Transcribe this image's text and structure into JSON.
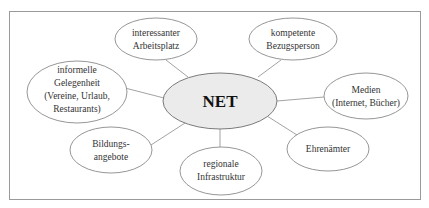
{
  "diagram": {
    "center": {
      "label": "NET"
    },
    "nodes": [
      {
        "id": "arbeitsplatz",
        "lines": [
          "interessanter",
          "Arbeitsplatz"
        ]
      },
      {
        "id": "bezugsperson",
        "lines": [
          "kompetente",
          "Bezugsperson"
        ]
      },
      {
        "id": "gelegenheit",
        "lines": [
          "informelle",
          "Gelegenheit",
          "(Vereine, Urlaub,",
          "Restaurants)"
        ]
      },
      {
        "id": "medien",
        "lines": [
          "Medien",
          "(Internet, Bücher)"
        ]
      },
      {
        "id": "bildung",
        "lines": [
          "Bildungs-",
          "angebote"
        ]
      },
      {
        "id": "infrastruktur",
        "lines": [
          "regionale",
          "Infrastruktur"
        ]
      },
      {
        "id": "ehrenaemter",
        "lines": [
          "Ehrenämter"
        ]
      }
    ]
  },
  "colors": {
    "frame": "#9a9a9a",
    "ellipse_stroke": "#8a8a8a",
    "center_fill": "#ebebeb",
    "connector": "#8c8c8c"
  }
}
